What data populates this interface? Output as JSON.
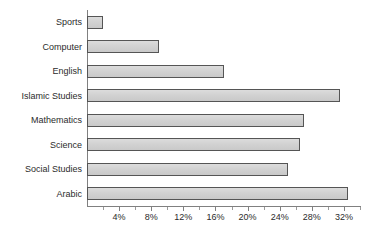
{
  "chart_data": {
    "type": "bar",
    "orientation": "horizontal",
    "title": "",
    "subtitle": "",
    "xlabel": "",
    "ylabel": "",
    "categories": [
      "Sports",
      "Computer",
      "English",
      "Islamic Studies",
      "Mathematics",
      "Science",
      "Social Studies",
      "Arabic"
    ],
    "values": [
      2,
      9,
      17,
      31.5,
      27,
      26.5,
      25,
      32.5
    ],
    "value_suffix": "%",
    "xlim": [
      0,
      34
    ],
    "xticks": [
      4,
      8,
      12,
      16,
      20,
      24,
      28,
      32
    ],
    "xtick_labels": [
      "4%",
      "8%",
      "12%",
      "16%",
      "20%",
      "24%",
      "28%",
      "32%"
    ],
    "minor_xticks": [
      2,
      6,
      10,
      14,
      18,
      22,
      26,
      30,
      34
    ],
    "grid": false,
    "legend": null,
    "legend_position": "none",
    "annotations": [],
    "colors": {
      "bar_fill": "#d2d2d2",
      "bar_border": "#555555",
      "axis": "#808080",
      "text": "#2b2b2b",
      "background": "#ffffff"
    }
  }
}
